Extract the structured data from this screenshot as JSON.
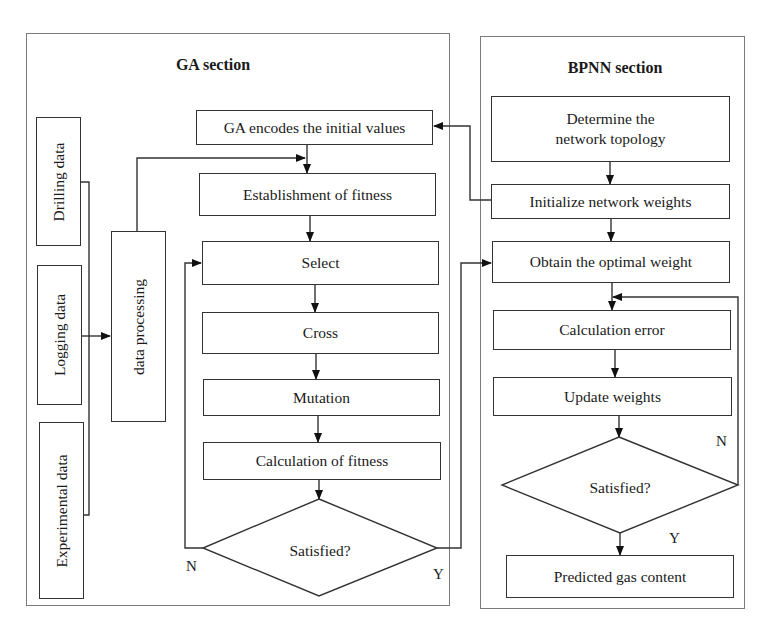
{
  "ga_section": {
    "title": "GA section",
    "inputs": {
      "drilling": "Drilling data",
      "logging": "Logging data",
      "experimental": "Experimental data"
    },
    "processing": "data processing",
    "steps": {
      "encode": "GA encodes the initial values",
      "establish": "Establishment of fitness",
      "select": "Select",
      "cross": "Cross",
      "mutation": "Mutation",
      "calc_fitness": "Calculation of fitness"
    },
    "decision": "Satisfied?",
    "no_label": "N",
    "yes_label": "Y"
  },
  "bpnn_section": {
    "title": "BPNN section",
    "steps": {
      "topology": "Determine the network topology",
      "init_weights": "Initialize network weights",
      "optimal_weight": "Obtain the optimal weight",
      "calc_error": "Calculation error",
      "update_weights": "Update weights",
      "predicted": "Predicted gas content"
    },
    "decision": "Satisfied?",
    "no_label": "N",
    "yes_label": "Y"
  }
}
